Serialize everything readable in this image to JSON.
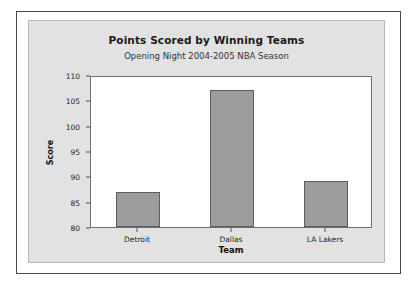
{
  "chart_data": {
    "type": "bar",
    "title": "Points Scored by Winning Teams",
    "subtitle": "Opening Night 2004-2005 NBA Season",
    "categories": [
      "Detroit",
      "Dallas",
      "LA Lakers"
    ],
    "values": [
      87,
      107,
      89
    ],
    "xlabel": "Team",
    "ylabel": "Score",
    "ylim": [
      80,
      110
    ],
    "yticks": [
      80,
      85,
      90,
      95,
      100,
      105,
      110
    ],
    "grid": false,
    "legend": "none",
    "bar_fill_color": "#9d9d9d",
    "bar_border_color": "#5e5e5e",
    "plot_background_color": "#ffffff",
    "panel_background_color": "#e2e2e2",
    "frame_color": "#4a4a4a"
  }
}
